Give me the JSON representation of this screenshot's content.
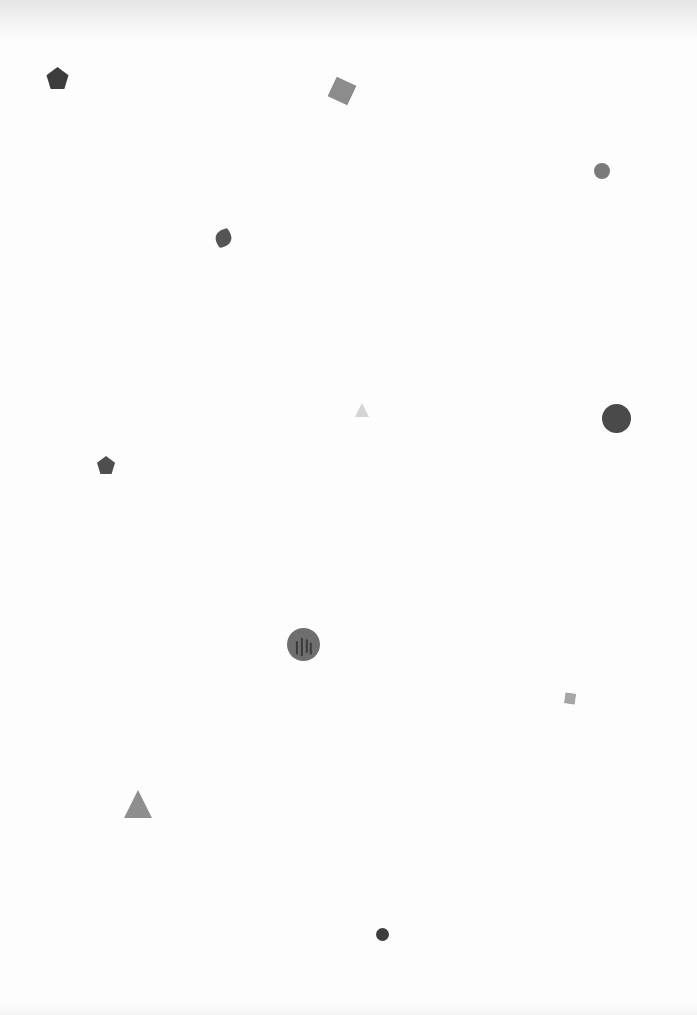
{
  "page": {
    "background": "#fdfdfd",
    "shapes": [
      {
        "id": "pentagon-1",
        "type": "pentagon",
        "x": 46,
        "y": 67,
        "w": 23,
        "h": 22,
        "color": "#3c3c3c",
        "rotate": 0
      },
      {
        "id": "square-1",
        "type": "square",
        "x": 331,
        "y": 80,
        "w": 22,
        "h": 22,
        "color": "#8c8c8c",
        "rotate": 25
      },
      {
        "id": "circle-1",
        "type": "circle",
        "x": 594,
        "y": 163,
        "w": 16,
        "h": 16,
        "color": "#7a7a7a",
        "rotate": 0
      },
      {
        "id": "leaf-1",
        "type": "leaf",
        "x": 213,
        "y": 223,
        "w": 21,
        "h": 30,
        "color": "#555555",
        "rotate": 20
      },
      {
        "id": "triangle-1",
        "type": "triangle",
        "x": 355,
        "y": 403,
        "w": 14,
        "h": 14,
        "color": "#d4d4d4",
        "rotate": 0
      },
      {
        "id": "circle-2",
        "type": "circle",
        "x": 602,
        "y": 404,
        "w": 29,
        "h": 29,
        "color": "#4a4a4a",
        "rotate": 0
      },
      {
        "id": "pentagon-2",
        "type": "pentagon",
        "x": 97,
        "y": 456,
        "w": 18,
        "h": 18,
        "color": "#4e4e4e",
        "rotate": 0
      },
      {
        "id": "circle-textured",
        "type": "circle",
        "x": 287,
        "y": 628,
        "w": 33,
        "h": 33,
        "color": "#6e6e6e",
        "rotate": 0
      },
      {
        "id": "square-2",
        "type": "square",
        "x": 565,
        "y": 690,
        "w": 11,
        "h": 11,
        "color": "#a6a6a6",
        "rotate": 8
      },
      {
        "id": "triangle-2",
        "type": "triangle",
        "x": 124,
        "y": 790,
        "w": 28,
        "h": 28,
        "color": "#8e8e8e",
        "rotate": 0
      },
      {
        "id": "circle-3",
        "type": "circle",
        "x": 376,
        "y": 927,
        "w": 13,
        "h": 13,
        "color": "#3e3e3e",
        "rotate": 0
      }
    ]
  }
}
